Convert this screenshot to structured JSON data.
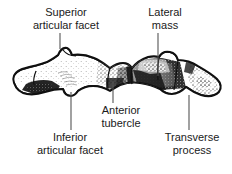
{
  "figure": {
    "ink_color": "#111111",
    "background_color": "#ffffff",
    "leader_line_color": "#555555"
  },
  "labels": {
    "superior_articular_facet": "Superior\narticular facet",
    "lateral_mass": "Lateral\nmass",
    "anterior_tubercle": "Anterior\ntubercle",
    "inferior_articular_facet": "Inferior\narticular facet",
    "transverse_process": "Transverse\nprocess"
  },
  "leader_lines": [
    {
      "name": "leader-superior-articular-facet",
      "x1": 60,
      "y1": 33,
      "x2": 60,
      "y2": 49
    },
    {
      "name": "leader-lateral-mass",
      "x1": 158,
      "y1": 33,
      "x2": 158,
      "y2": 76
    },
    {
      "name": "leader-anterior-tubercle",
      "x1": 113,
      "y1": 81,
      "x2": 113,
      "y2": 103
    },
    {
      "name": "leader-inferior-articular-facet",
      "x1": 71,
      "y1": 92,
      "x2": 71,
      "y2": 130
    },
    {
      "name": "leader-transverse-process",
      "x1": 189,
      "y1": 95,
      "x2": 189,
      "y2": 130
    }
  ],
  "anatomy_parts": [
    "superior articular facet",
    "lateral mass",
    "anterior tubercle",
    "inferior articular facet",
    "transverse process"
  ]
}
